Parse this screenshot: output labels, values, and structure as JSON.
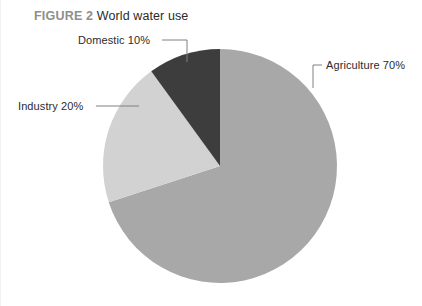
{
  "figure": {
    "number_label": "FIGURE 2",
    "title": "World water use"
  },
  "chart_data": {
    "type": "pie",
    "title": "World water use",
    "xlabel": "",
    "ylabel": "",
    "legend_position": "callout-labels",
    "grid": false,
    "categories": [
      "Agriculture",
      "Industry",
      "Domestic"
    ],
    "values": [
      70,
      20,
      10
    ],
    "units": "percent",
    "start_angle_deg": 0,
    "direction": "clockwise",
    "slices": [
      {
        "name": "Agriculture",
        "value": 70,
        "label": "Agriculture 70%",
        "color": "#a8a8a8",
        "start_deg": 0,
        "end_deg": 252
      },
      {
        "name": "Industry",
        "value": 20,
        "label": "Industry 20%",
        "color": "#d2d2d2",
        "start_deg": 252,
        "end_deg": 324
      },
      {
        "name": "Domestic",
        "value": 10,
        "label": "Domestic 10%",
        "color": "#3d3d3d",
        "start_deg": 324,
        "end_deg": 360
      }
    ]
  },
  "colors": {
    "background": "#ffffff",
    "agriculture": "#a8a8a8",
    "industry": "#d2d2d2",
    "domestic": "#3d3d3d",
    "leader_line": "#808080",
    "figure_number_text": "#8e8e8e",
    "title_text": "#2b2b2b",
    "label_text": "#2b2b2b"
  },
  "geometry": {
    "center_x": 220,
    "center_y": 166,
    "radius": 117
  }
}
